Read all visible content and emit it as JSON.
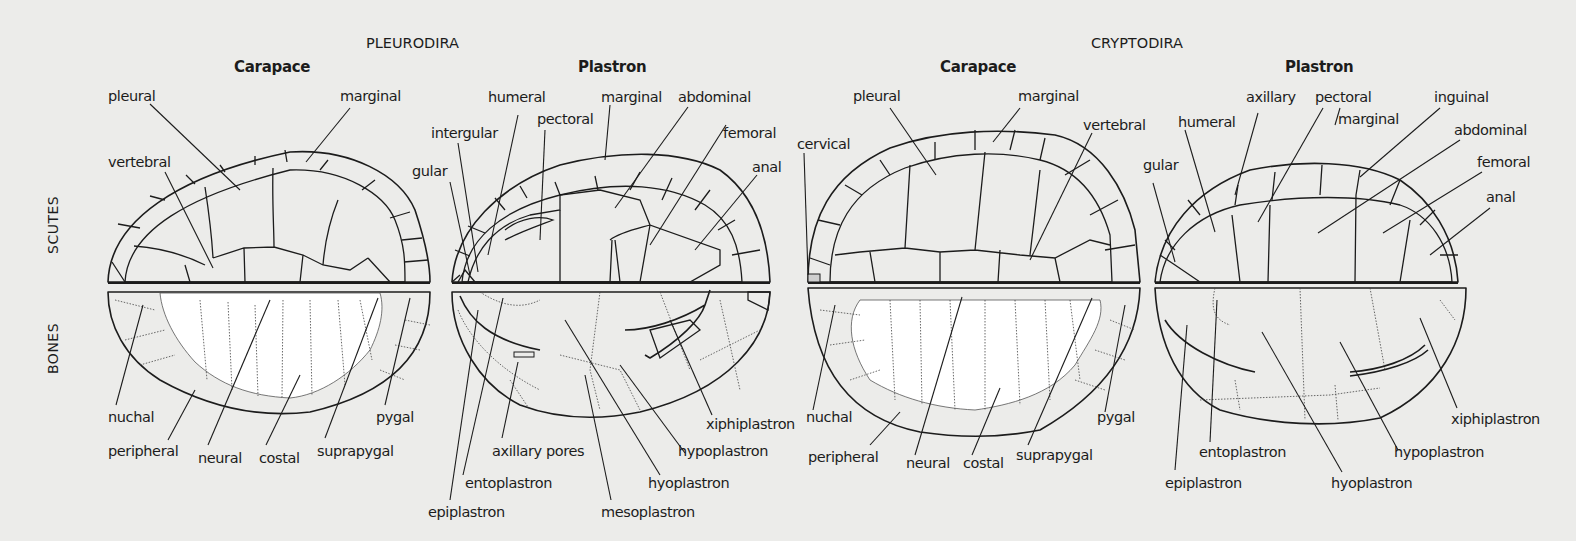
{
  "groups": {
    "pleurodira": "PLEURODIRA",
    "cryptodira": "CRYPTODIRA"
  },
  "row_labels": {
    "scutes": "SCUTES",
    "bones": "BONES"
  },
  "panels": {
    "pleuro_carapace": {
      "title": "Carapace",
      "scute_labels": [
        "pleural",
        "marginal",
        "vertebral"
      ],
      "bone_labels": [
        "nuchal",
        "peripheral",
        "neural",
        "costal",
        "suprapygal",
        "pygal"
      ]
    },
    "pleuro_plastron": {
      "title": "Plastron",
      "scute_labels": [
        "humeral",
        "marginal",
        "abdominal",
        "intergular",
        "pectoral",
        "femoral",
        "gular",
        "anal"
      ],
      "bone_labels": [
        "axillary pores",
        "xiphiplastron",
        "hypoplastron",
        "entoplastron",
        "hyoplastron",
        "epiplastron",
        "mesoplastron"
      ]
    },
    "crypto_carapace": {
      "title": "Carapace",
      "scute_labels": [
        "pleural",
        "marginal",
        "vertebral",
        "cervical"
      ],
      "bone_labels": [
        "nuchal",
        "pygal",
        "peripheral",
        "neural",
        "costal",
        "suprapygal"
      ]
    },
    "crypto_plastron": {
      "title": "Plastron",
      "scute_labels": [
        "axillary",
        "pectoral",
        "inguinal",
        "humeral",
        "marginal",
        "abdominal",
        "gular",
        "femoral",
        "anal"
      ],
      "bone_labels": [
        "xiphiplastron",
        "entoplastron",
        "hypoplastron",
        "epiplastron",
        "hyoplastron"
      ]
    }
  },
  "colors": {
    "background": "#ececea",
    "scute_dark": "#9a9a9a",
    "scute_light": "#cfcfcf",
    "bone_white": "#ffffff",
    "outline": "#1c1c1c"
  }
}
